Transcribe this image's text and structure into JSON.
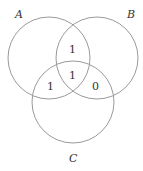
{
  "diagram": {
    "type": "venn",
    "sets": [
      {
        "name": "A",
        "label": "A"
      },
      {
        "name": "B",
        "label": "B"
      },
      {
        "name": "C",
        "label": "C"
      }
    ],
    "regions": {
      "AB_only": "1",
      "ABC": "1",
      "AC_only": "1",
      "BC_only": "0"
    },
    "stroke_color": "#9a9a9a"
  }
}
